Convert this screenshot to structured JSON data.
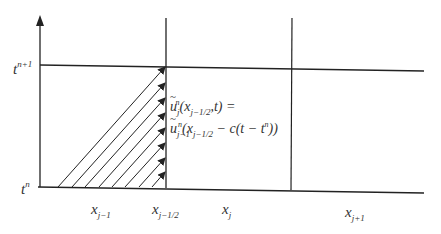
{
  "diagram": {
    "type": "finite-volume space-time cell diagram",
    "y_axis": {
      "labels": {
        "t_n": "t",
        "t_n_sup": "n",
        "t_n1": "t",
        "t_n1_sup": "n+1"
      }
    },
    "x_labels": [
      {
        "base": "x",
        "sub": "j−1"
      },
      {
        "base": "x",
        "sub": "j−1/2"
      },
      {
        "base": "x",
        "sub": "j"
      },
      {
        "base": "x",
        "sub": "j+1"
      }
    ],
    "equation": {
      "line1": {
        "func": "u",
        "sub": "j",
        "sup": "n",
        "arg_open": "(x",
        "arg_sub": "j−1/2",
        "arg_close": ",t) ="
      },
      "line2": {
        "func": "u",
        "sub": "j−1",
        "sup": "n",
        "arg_open": "(x",
        "arg_sub": "j−1/2",
        "mid": " − c(t − t",
        "t_sup": "n",
        "end": "))"
      }
    },
    "colors": {
      "line": "#222222",
      "background": "#ffffff"
    }
  }
}
